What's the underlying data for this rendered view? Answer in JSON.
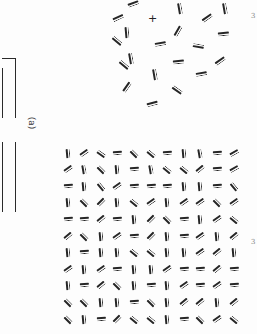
{
  "figure": {
    "panel_label": "(a)",
    "fixation_mark": "+",
    "right_edge_marks": [
      "3",
      "3"
    ],
    "ink_color": "#262626",
    "background": "#fdfdfd"
  },
  "cluster": {
    "description": "Circular cluster of double-bar elements around fixation point",
    "fixation": {
      "x": 151,
      "y": 18
    },
    "elements": [
      {
        "x": 133,
        "y": 4,
        "angle": 20
      },
      {
        "x": 180,
        "y": 8,
        "angle": 100
      },
      {
        "x": 225,
        "y": 8,
        "angle": 100
      },
      {
        "x": 127,
        "y": 32,
        "angle": 95
      },
      {
        "x": 178,
        "y": 31,
        "angle": 60
      },
      {
        "x": 207,
        "y": 18,
        "angle": 35
      },
      {
        "x": 223,
        "y": 34,
        "angle": 5
      },
      {
        "x": 160,
        "y": 44,
        "angle": 10
      },
      {
        "x": 198,
        "y": 45,
        "angle": 170
      },
      {
        "x": 131,
        "y": 58,
        "angle": 100
      },
      {
        "x": 178,
        "y": 62,
        "angle": 5
      },
      {
        "x": 220,
        "y": 61,
        "angle": 35
      },
      {
        "x": 155,
        "y": 74,
        "angle": 100
      },
      {
        "x": 201,
        "y": 74,
        "angle": 10
      },
      {
        "x": 127,
        "y": 87,
        "angle": 55
      },
      {
        "x": 177,
        "y": 89,
        "angle": 145
      },
      {
        "x": 152,
        "y": 104,
        "angle": 15
      },
      {
        "x": 118,
        "y": 18,
        "angle": 25
      },
      {
        "x": 117,
        "y": 40,
        "angle": 140
      },
      {
        "x": 124,
        "y": 64,
        "angle": 140
      }
    ]
  },
  "grid": {
    "description": "11x11 texture grid of double-bar elements at varied orientations",
    "origin": {
      "x": 68,
      "y": 153
    },
    "spacing": {
      "x": 16.6,
      "y": 16.6
    },
    "rows": [
      [
        95,
        35,
        145,
        5,
        135,
        140,
        5,
        95,
        100,
        5,
        30
      ],
      [
        35,
        100,
        135,
        95,
        5,
        100,
        140,
        140,
        40,
        5,
        30
      ],
      [
        5,
        95,
        130,
        35,
        5,
        5,
        5,
        95,
        95,
        5,
        130
      ],
      [
        95,
        135,
        45,
        95,
        140,
        35,
        95,
        35,
        35,
        135,
        35
      ],
      [
        5,
        5,
        40,
        5,
        95,
        45,
        135,
        5,
        95,
        35,
        140
      ],
      [
        40,
        135,
        95,
        35,
        5,
        45,
        95,
        5,
        35,
        95,
        40
      ],
      [
        95,
        5,
        95,
        95,
        140,
        140,
        95,
        95,
        35,
        40,
        95
      ],
      [
        35,
        95,
        35,
        5,
        95,
        95,
        35,
        5,
        5,
        40,
        5
      ],
      [
        95,
        5,
        40,
        135,
        95,
        5,
        95,
        35,
        5,
        35,
        5
      ],
      [
        135,
        135,
        95,
        95,
        5,
        135,
        95,
        40,
        40,
        95,
        40
      ],
      [
        135,
        95,
        5,
        45,
        140,
        140,
        95,
        5,
        135,
        35,
        140
      ]
    ]
  },
  "bracket": {
    "upper": {
      "x": 2,
      "y": 58,
      "w": 14,
      "h": 60
    },
    "lower_lines": [
      {
        "x": 2,
        "y": 142,
        "h": 70
      },
      {
        "x": 15,
        "y": 142,
        "h": 70
      }
    ]
  }
}
